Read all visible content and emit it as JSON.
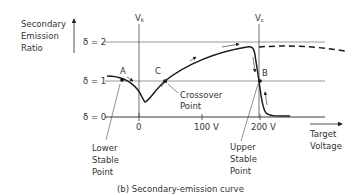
{
  "diagram": {
    "caption": "(b) Secondary-emission curve",
    "y_axis_label": [
      "Secondary",
      "Emission",
      "Ratio"
    ],
    "x_axis_label": [
      "Target",
      "Voltage"
    ],
    "levels": {
      "delta2": "δ = 2",
      "delta1": "δ = 1",
      "delta0": "δ = 0"
    },
    "vertical_markers": {
      "vk": "V",
      "vk_sub": "k",
      "vc": "V",
      "vc_sub": "c"
    },
    "x_ticks": {
      "zero": "0",
      "hundred": "100 V",
      "two_hundred": "200 V"
    },
    "points": {
      "a": "A",
      "b": "B",
      "c": "C"
    },
    "annotations": {
      "crossover": [
        "Crossover",
        "Point"
      ],
      "lower_stable": [
        "Lower",
        "Stable",
        "Point"
      ],
      "upper_stable": [
        "Upper",
        "Stable",
        "Point"
      ]
    }
  }
}
